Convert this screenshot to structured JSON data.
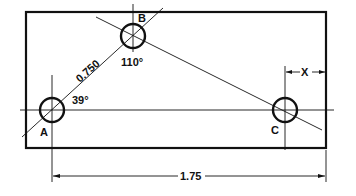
{
  "diagram": {
    "type": "engineering-drawing",
    "stroke_color": "#111111",
    "background": "#ffffff",
    "plate": {
      "x": 26,
      "y": 12,
      "width": 300,
      "height": 136
    },
    "holes": [
      {
        "id": "A",
        "label": "A",
        "cx": 52,
        "cy": 110,
        "r": 12
      },
      {
        "id": "B",
        "label": "B",
        "cx": 133,
        "cy": 36,
        "r": 12
      },
      {
        "id": "C",
        "label": "C",
        "cx": 285,
        "cy": 110,
        "r": 12
      }
    ],
    "dimensions": {
      "ab_distance": "0.750",
      "angle_at_a": "39°",
      "angle_at_b": "110°",
      "ac_distance": "1.75",
      "unknown": "X"
    }
  }
}
